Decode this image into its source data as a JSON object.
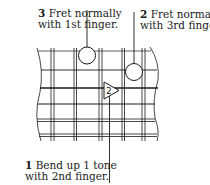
{
  "diagram": {
    "annotations": [
      {
        "number": "3",
        "line1": "Fret normally",
        "line2": "with 1st finger.",
        "marker": "circle"
      },
      {
        "number": "2",
        "line1": "Fret normally",
        "line2": "with 3rd finger.",
        "marker": "circle"
      },
      {
        "number": "1",
        "line1": "Bend up 1 tone",
        "line2": "with 2nd finger.",
        "marker": "triangle"
      }
    ],
    "bend_marker_label": "2",
    "colors": {
      "ink": "#1a1a1a",
      "background": "#ffffff"
    }
  }
}
